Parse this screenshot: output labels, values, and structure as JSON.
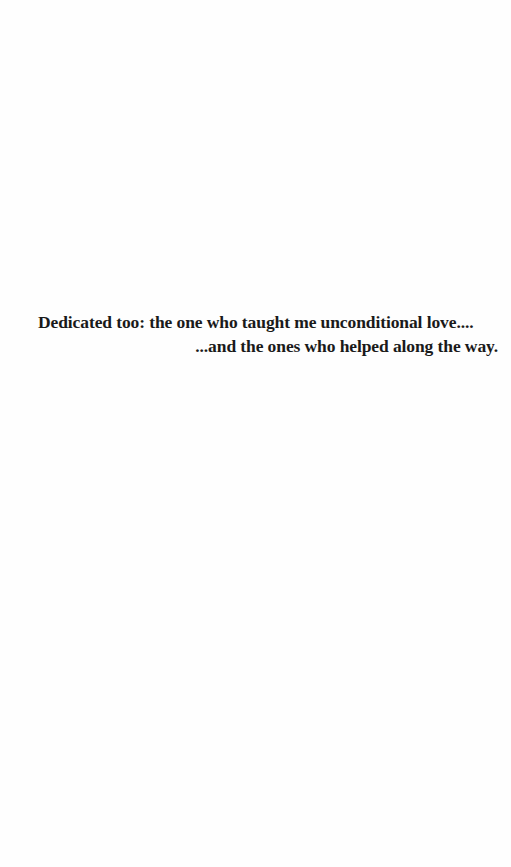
{
  "page": {
    "background": "#ffffff",
    "text_color": "#1a1a1a"
  },
  "dedication": {
    "line1": "Dedicated too: the one who taught me unconditional love....",
    "line2": "...and the ones who helped along the way."
  }
}
